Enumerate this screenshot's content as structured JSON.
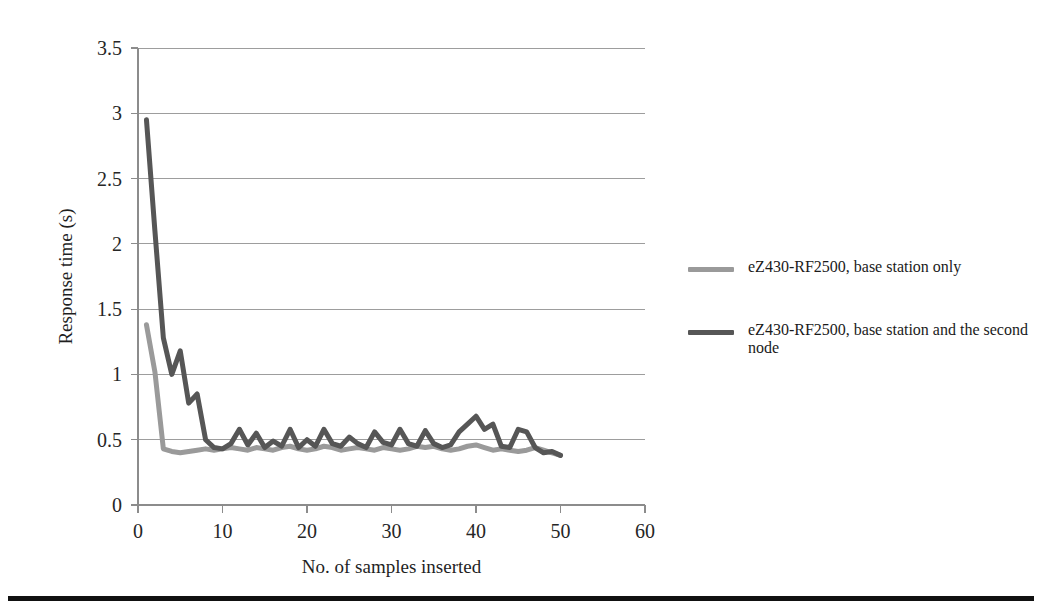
{
  "figure": {
    "background_color": "#ffffff",
    "bottom_rule_color": "#111111"
  },
  "legend": {
    "position": "right",
    "items": [
      {
        "label": "eZ430-RF2500, base station only",
        "color": "#9a9a9a"
      },
      {
        "label": "eZ430-RF2500, base station and the second node",
        "color": "#565656"
      }
    ]
  },
  "chart_data": {
    "type": "line",
    "title": "",
    "xlabel": "No. of samples inserted",
    "ylabel": "Response time (s)",
    "xlim": [
      0,
      60
    ],
    "ylim": [
      0,
      3.5
    ],
    "xticks": [
      0,
      10,
      20,
      30,
      40,
      50,
      60
    ],
    "xtick_labels": [
      "0",
      "10",
      "20",
      "30",
      "40",
      "50",
      "60"
    ],
    "yticks": [
      0,
      0.5,
      1,
      1.5,
      2,
      2.5,
      3,
      3.5
    ],
    "ytick_labels": [
      "0",
      "0.5",
      "1",
      "1.5",
      "2",
      "2.5",
      "3",
      "3.5"
    ],
    "grid": "horizontal",
    "grid_color": "#9d9d9d",
    "axis_color": "#8c8c8c",
    "legend_position": "right-outside",
    "x": [
      1,
      2,
      3,
      4,
      5,
      6,
      7,
      8,
      9,
      10,
      11,
      12,
      13,
      14,
      15,
      16,
      17,
      18,
      19,
      20,
      21,
      22,
      23,
      24,
      25,
      26,
      27,
      28,
      29,
      30,
      31,
      32,
      33,
      34,
      35,
      36,
      37,
      38,
      39,
      40,
      41,
      42,
      43,
      44,
      45,
      46,
      47,
      48,
      49,
      50
    ],
    "series": [
      {
        "name": "eZ430-RF2500, base station only",
        "color": "#9a9a9a",
        "line_width": 5,
        "values": [
          1.38,
          1.02,
          0.43,
          0.41,
          0.4,
          0.41,
          0.42,
          0.43,
          0.42,
          0.43,
          0.44,
          0.43,
          0.42,
          0.44,
          0.43,
          0.42,
          0.44,
          0.45,
          0.43,
          0.42,
          0.43,
          0.45,
          0.44,
          0.42,
          0.43,
          0.44,
          0.43,
          0.42,
          0.44,
          0.43,
          0.42,
          0.43,
          0.45,
          0.44,
          0.45,
          0.43,
          0.42,
          0.43,
          0.45,
          0.46,
          0.44,
          0.42,
          0.43,
          0.42,
          0.41,
          0.42,
          0.44,
          0.42,
          0.4,
          0.38
        ]
      },
      {
        "name": "eZ430-RF2500, base station and the second node",
        "color": "#565656",
        "line_width": 5,
        "values": [
          2.95,
          2.1,
          1.28,
          1.0,
          1.18,
          0.78,
          0.85,
          0.5,
          0.44,
          0.43,
          0.47,
          0.58,
          0.46,
          0.55,
          0.44,
          0.49,
          0.45,
          0.58,
          0.44,
          0.5,
          0.45,
          0.58,
          0.47,
          0.45,
          0.52,
          0.47,
          0.44,
          0.56,
          0.48,
          0.46,
          0.58,
          0.47,
          0.45,
          0.57,
          0.47,
          0.44,
          0.46,
          0.56,
          0.62,
          0.68,
          0.58,
          0.62,
          0.45,
          0.44,
          0.58,
          0.56,
          0.44,
          0.4,
          0.41,
          0.38
        ]
      }
    ]
  }
}
